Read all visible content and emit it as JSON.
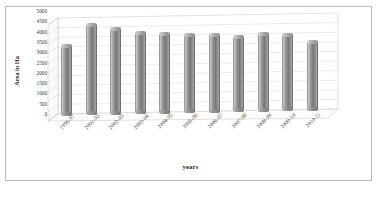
{
  "chart_data": {
    "type": "bar",
    "title": "",
    "subtitle": "",
    "xlabel": "years",
    "ylabel": "Area in Ha",
    "categories": [
      "1996-97",
      "2001-02",
      "2002-03",
      "2003-04",
      "2004-05",
      "2005-06",
      "2006-07",
      "2007-08",
      "2008-09",
      "2009-10",
      "2010-11"
    ],
    "values": [
      3650,
      4700,
      4500,
      4250,
      4150,
      4100,
      4050,
      3950,
      4050,
      4000,
      3600
    ],
    "ylim": [
      0,
      5000
    ],
    "ytick_values": [
      5000,
      4500,
      4000,
      3500,
      3000,
      2500,
      2000,
      1500,
      1000,
      500,
      0
    ],
    "ytick_labels": [
      "5000",
      "4500",
      "4000",
      "3500",
      "3000",
      "2500",
      "2000",
      "1500",
      "1000",
      "500",
      "0"
    ],
    "grid": true,
    "legend": false,
    "legend_position": "none",
    "style": "3d-cylinder",
    "series": [
      {
        "name": "Area in Ha",
        "values": [
          3650,
          4700,
          4500,
          4250,
          4150,
          4100,
          4050,
          3950,
          4050,
          4000,
          3600
        ]
      }
    ],
    "annotations": []
  },
  "colors": {
    "bar_fill": "#8c8c8c",
    "bar_highlight": "#cfcfcf",
    "bar_shadow": "#787878",
    "gridline": "#c9c9c9",
    "axis": "#a0a0a0",
    "frame": "#b9b9b9",
    "text": "#3b3b3b",
    "background": "#ffffff"
  }
}
